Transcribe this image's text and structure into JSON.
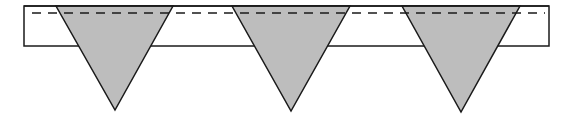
{
  "diagram": {
    "width": 571,
    "height": 121,
    "colors": {
      "background": "#ffffff",
      "stroke": "#1a1a1a",
      "triangle_fill": "#bdbdbd"
    },
    "bar": {
      "x": 24,
      "y": 6,
      "width": 525,
      "height": 40
    },
    "dashed_line": {
      "x1": 32,
      "x2": 545,
      "y": 13,
      "dash": 9,
      "gap": 7
    },
    "triangles": [
      {
        "name": "triangle-1",
        "top_left": [
          56,
          6
        ],
        "top_right": [
          173,
          6
        ],
        "apex": [
          115,
          110
        ]
      },
      {
        "name": "triangle-2",
        "top_left": [
          232,
          6
        ],
        "top_right": [
          350,
          6
        ],
        "apex": [
          291,
          111
        ]
      },
      {
        "name": "triangle-3",
        "top_left": [
          402,
          6
        ],
        "top_right": [
          520,
          6
        ],
        "apex": [
          461,
          112
        ]
      }
    ]
  }
}
